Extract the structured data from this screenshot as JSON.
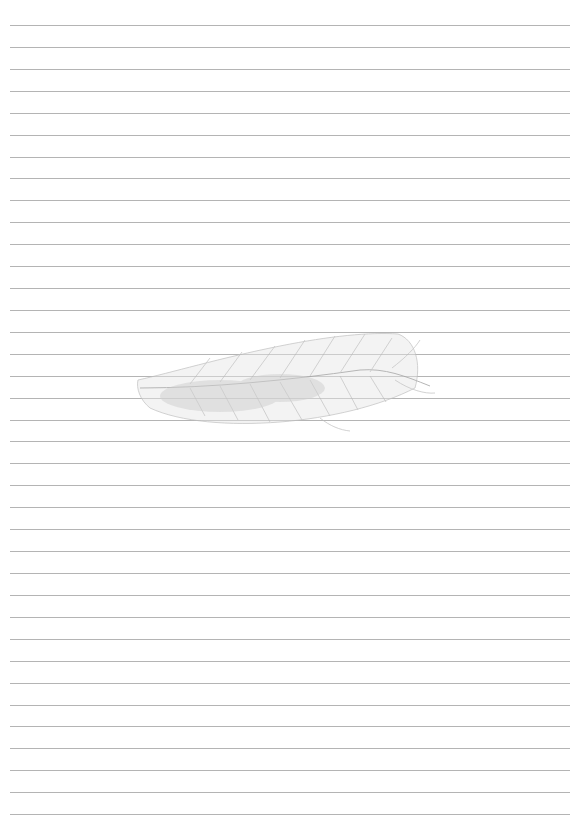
{
  "page": {
    "background": "#ffffff",
    "lines": {
      "count": 37,
      "first_y": 25,
      "spacing": 21.92,
      "left": 10,
      "right": 570,
      "color": "#b4b4b4"
    },
    "watermark": {
      "icon": "feather-icon",
      "color": "#c8c8c8",
      "x": 135,
      "y": 325,
      "width": 305,
      "height": 105
    }
  }
}
